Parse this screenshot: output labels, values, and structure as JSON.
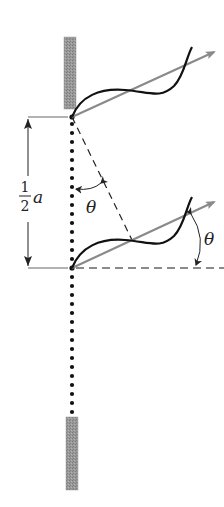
{
  "diagram": {
    "labels": {
      "half_numerator": "1",
      "half_denominator": "2",
      "half_variable": "a",
      "theta_upper": "θ",
      "theta_lower": "θ"
    },
    "colors": {
      "background": "#ffffff",
      "slit_bar": "#8c8c8c",
      "wave": "#111111",
      "ray": "#8a8a8a",
      "dots": "#111111",
      "dimension_line": "#444444",
      "dashed_construction": "#222222",
      "dashed_horizontal": "#8a8a8a"
    },
    "elements": {
      "upper_barrier": "upper slit barrier",
      "lower_barrier": "lower slit barrier",
      "upper_slit_point": "upper slit source",
      "lower_slit_point": "lower slit source (center)",
      "dimension": "separation one-half a",
      "upper_ray": "ray from upper source at angle theta",
      "lower_ray": "ray from center source at angle theta",
      "perpendicular": "dashed perpendicular showing path difference",
      "horizontal_reference": "dashed horizontal reference line"
    }
  }
}
